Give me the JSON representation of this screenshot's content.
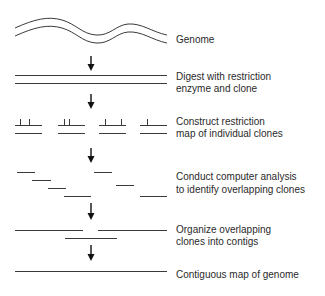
{
  "diagram": {
    "colors": {
      "line": "#3a3a3a",
      "arrow": "#111111",
      "text": "#2a2a2a",
      "background": "#ffffff"
    },
    "steps": [
      {
        "id": "genome",
        "lines": [
          "Genome"
        ]
      },
      {
        "id": "digest",
        "lines": [
          "Digest with restriction",
          "enzyme and clone"
        ]
      },
      {
        "id": "restriction-map",
        "lines": [
          "Construct restriction",
          "map of individual clones"
        ]
      },
      {
        "id": "computer-analysis",
        "lines": [
          "Conduct computer analysis",
          "to identify overlapping clones"
        ]
      },
      {
        "id": "contigs",
        "lines": [
          "Organize overlapping",
          "clones into contigs"
        ]
      },
      {
        "id": "contiguous-map",
        "lines": [
          "Contiguous map of genome"
        ]
      }
    ],
    "arrow_count": 5,
    "clone_count": 4,
    "overlap_fragment_count": 7,
    "contig_fragment_count": 3
  }
}
